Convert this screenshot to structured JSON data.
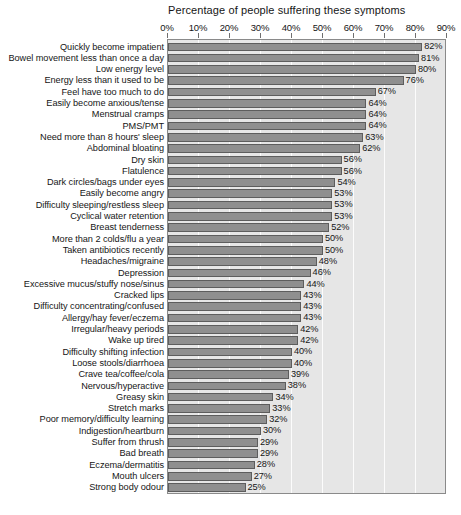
{
  "chart_data": {
    "type": "bar",
    "orientation": "horizontal",
    "title": "Percentage of people suffering these symptoms",
    "xlabel": "",
    "ylabel": "",
    "xlim": [
      0,
      90
    ],
    "xticks": [
      "0%",
      "10%",
      "20%",
      "30%",
      "40%",
      "50%",
      "60%",
      "70%",
      "80%",
      "90%"
    ],
    "xtick_values": [
      0,
      10,
      20,
      30,
      40,
      50,
      60,
      70,
      80,
      90
    ],
    "grid": true,
    "legend": "none",
    "value_label_suffix": "%",
    "categories": [
      "Quickly become impatient",
      "Bowel movement less than once a day",
      "Low energy level",
      "Energy less than it used to be",
      "Feel have too much to do",
      "Easily become anxious/tense",
      "Menstrual cramps",
      "PMS/PMT",
      "Need more than 8 hours' sleep",
      "Abdominal bloating",
      "Dry skin",
      "Flatulence",
      "Dark circles/bags under eyes",
      "Easily become angry",
      "Difficulty sleeping/restless sleep",
      "Cyclical water retention",
      "Breast tenderness",
      "More than 2 colds/flu a year",
      "Taken antibiotics recently",
      "Headaches/migraine",
      "Depression",
      "Excessive mucus/stuffy nose/sinus",
      "Cracked lips",
      "Difficulty concentrating/confused",
      "Allergy/hay fever/eczema",
      "Irregular/heavy periods",
      "Wake up tired",
      "Difficulty shifting infection",
      "Loose stools/diarrhoea",
      "Crave tea/coffee/cola",
      "Nervous/hyperactive",
      "Greasy skin",
      "Stretch marks",
      "Poor memory/difficulty learning",
      "Indigestion/heartburn",
      "Suffer from thrush",
      "Bad breath",
      "Eczema/dermatitis",
      "Mouth ulcers",
      "Strong body odour"
    ],
    "values": [
      82,
      81,
      80,
      76,
      67,
      64,
      64,
      64,
      63,
      62,
      56,
      56,
      54,
      53,
      53,
      53,
      52,
      50,
      50,
      48,
      46,
      44,
      43,
      43,
      43,
      42,
      42,
      40,
      40,
      39,
      38,
      34,
      33,
      32,
      30,
      29,
      29,
      28,
      27,
      25
    ],
    "value_labels": [
      "82%",
      "81%",
      "80%",
      "76%",
      "67%",
      "64%",
      "64%",
      "64%",
      "63%",
      "62%",
      "56%",
      "56%",
      "54%",
      "53%",
      "53%",
      "53%",
      "52%",
      "50%",
      "50%",
      "48%",
      "46%",
      "44%",
      "43%",
      "43%",
      "43%",
      "42%",
      "42%",
      "40%",
      "40%",
      "39%",
      "38%",
      "34%",
      "33%",
      "32%",
      "30%",
      "29%",
      "29%",
      "28%",
      "27%",
      "25%"
    ],
    "colors": {
      "bar_fill": "#8f8f8f",
      "bar_border": "#5d5d5d",
      "plot_background": "#e6e6e6",
      "plot_border": "#8a8a8a",
      "gridline": "#ffffff",
      "text": "#161616",
      "page_background": "#ffffff"
    }
  }
}
